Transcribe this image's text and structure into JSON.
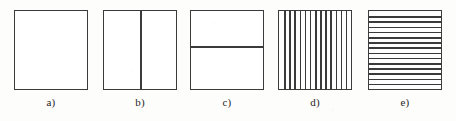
{
  "diagram": {
    "background_color": "#fdfdfc",
    "stroke_color": "#3b3b3b",
    "fill_color": "#ffffff",
    "figure_count": 5,
    "figures": [
      {
        "id": "a",
        "caption": "a)",
        "pattern": "empty",
        "description": "Plain square outline with no internal divisions",
        "interior_line_count": 0,
        "interior_line_orientation": "none"
      },
      {
        "id": "b",
        "caption": "b)",
        "pattern": "single-vertical-divider",
        "description": "Square divided into two equal halves by one vertical line",
        "interior_line_count": 1,
        "interior_line_orientation": "vertical",
        "divider_position_percent": 50
      },
      {
        "id": "c",
        "caption": "c)",
        "pattern": "single-horizontal-divider",
        "description": "Square divided by one horizontal line set slightly above centre",
        "interior_line_count": 1,
        "interior_line_orientation": "horizontal",
        "divider_position_percent": 45
      },
      {
        "id": "d",
        "caption": "d)",
        "pattern": "vertical-hatching",
        "description": "Square filled with closely spaced vertical lines",
        "interior_line_count": 13,
        "interior_line_orientation": "vertical"
      },
      {
        "id": "e",
        "caption": "e)",
        "pattern": "horizontal-hatching",
        "description": "Square filled with closely spaced horizontal lines",
        "interior_line_count": 14,
        "interior_line_orientation": "horizontal"
      }
    ]
  }
}
